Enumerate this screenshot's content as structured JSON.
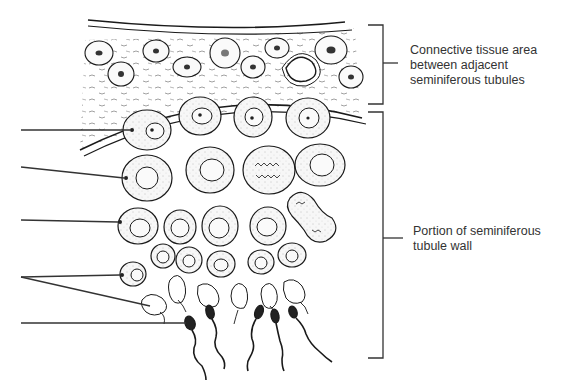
{
  "diagram": {
    "labels": {
      "connective": {
        "lines": [
          "Connective tissue area",
          "between adjacent",
          "seminiferous tubules"
        ]
      },
      "tubule_wall": {
        "lines": [
          "Portion of seminiferous",
          "tubule wall"
        ]
      }
    },
    "leader_lines_left": [
      {
        "y": 130,
        "target": "spermatogonium"
      },
      {
        "y": 167,
        "target": "primary spermatocyte"
      },
      {
        "y": 220,
        "target": "secondary spermatocyte"
      },
      {
        "y": 277,
        "target": "spermatids",
        "branches": 2
      },
      {
        "y": 323,
        "target": "sperm"
      }
    ],
    "colors": {
      "ink": "#1a1a1a",
      "cell_fill": "#f4f4f4",
      "text": "#333333",
      "background": "#ffffff"
    }
  }
}
